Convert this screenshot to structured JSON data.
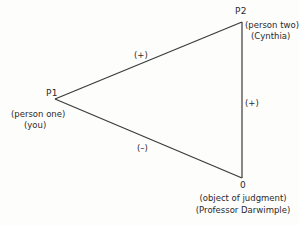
{
  "diagram": {
    "type": "balance-triangle",
    "nodes": {
      "p1": {
        "id": "P1",
        "role": "(person one)",
        "name": "(you)"
      },
      "p2": {
        "id": "P2",
        "role": "(person two)",
        "name": "(Cynthia)"
      },
      "o": {
        "id": "0",
        "role": "(object of judgment)",
        "name": "(Professor Darwimple)"
      }
    },
    "edges": [
      {
        "from": "P1",
        "to": "P2",
        "sign": "(+)"
      },
      {
        "from": "P2",
        "to": "0",
        "sign": "(+)"
      },
      {
        "from": "P1",
        "to": "0",
        "sign": "(–)"
      }
    ],
    "colors": {
      "line": "#3a3a3a",
      "text": "#2b2b2b",
      "background": "#fdfdfc"
    }
  }
}
